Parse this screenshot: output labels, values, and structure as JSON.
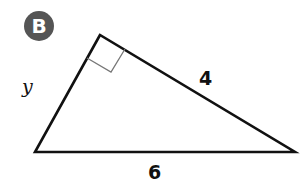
{
  "figure": {
    "badge_label": "B",
    "badge_color": "#555555",
    "shape": "right-triangle",
    "right_angle_at": "top-vertex",
    "sides": {
      "left_leg": "y",
      "right_leg": "4",
      "hypotenuse": "6"
    }
  }
}
